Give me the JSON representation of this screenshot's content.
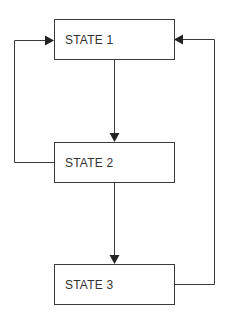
{
  "diagram": {
    "type": "state-flow",
    "states": [
      {
        "id": "s1",
        "label": "STATE 1"
      },
      {
        "id": "s2",
        "label": "STATE 2"
      },
      {
        "id": "s3",
        "label": "STATE 3"
      }
    ],
    "transitions": [
      {
        "from": "STATE 1",
        "to": "STATE 2"
      },
      {
        "from": "STATE 2",
        "to": "STATE 3"
      },
      {
        "from": "STATE 2",
        "to": "STATE 1"
      },
      {
        "from": "STATE 3",
        "to": "STATE 1"
      }
    ],
    "colors": {
      "line": "#3a3a3a",
      "text": "#333333",
      "background": "#ffffff"
    }
  }
}
